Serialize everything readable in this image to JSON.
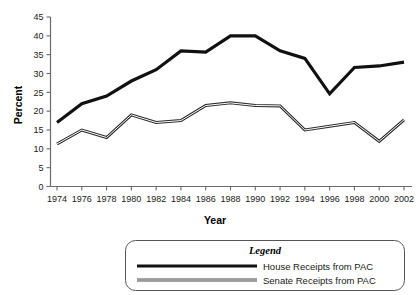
{
  "chart_data": {
    "type": "line",
    "title": "",
    "xlabel": "Year",
    "ylabel": "Percent",
    "grid": false,
    "legend_position": "bottom",
    "legend_title": "Legend",
    "x": [
      1974,
      1976,
      1978,
      1980,
      1982,
      1984,
      1986,
      1988,
      1990,
      1992,
      1994,
      1996,
      1998,
      2000,
      2002
    ],
    "xtick_labels": [
      "1974",
      "1976",
      "1978",
      "1980",
      "1982",
      "1984",
      "1986",
      "1988",
      "1990",
      "1992",
      "1994",
      "1996",
      "1998",
      "2000",
      "2002"
    ],
    "ytick_labels": [
      "0",
      "5",
      "10",
      "15",
      "20",
      "25",
      "30",
      "35",
      "40",
      "45"
    ],
    "ytick_values": [
      0,
      5,
      10,
      15,
      20,
      25,
      30,
      35,
      40,
      45
    ],
    "ylim": [
      0,
      45
    ],
    "xlim": [
      1974,
      2002
    ],
    "series": [
      {
        "name": "House Receipts from PAC",
        "color": "#111111",
        "style": "solid-thick",
        "values": [
          17.0,
          22.0,
          24.0,
          28.0,
          31.0,
          36.0,
          35.7,
          40.0,
          40.0,
          36.0,
          34.0,
          24.6,
          31.6,
          32.0,
          33.0
        ]
      },
      {
        "name": "Senate Receipts from PAC",
        "color": "#4a4a4a",
        "style": "double-line",
        "values": [
          11.3,
          15.0,
          13.0,
          19.0,
          17.0,
          17.5,
          21.5,
          22.2,
          21.5,
          21.4,
          15.0,
          16.0,
          17.0,
          12.0,
          17.7
        ]
      }
    ]
  },
  "axes": {
    "ylabel": "Percent",
    "xlabel": "Year"
  },
  "legend": {
    "title": "Legend",
    "entries": [
      {
        "label": "House Receipts from PAC"
      },
      {
        "label": "Senate Receipts from PAC"
      }
    ]
  }
}
